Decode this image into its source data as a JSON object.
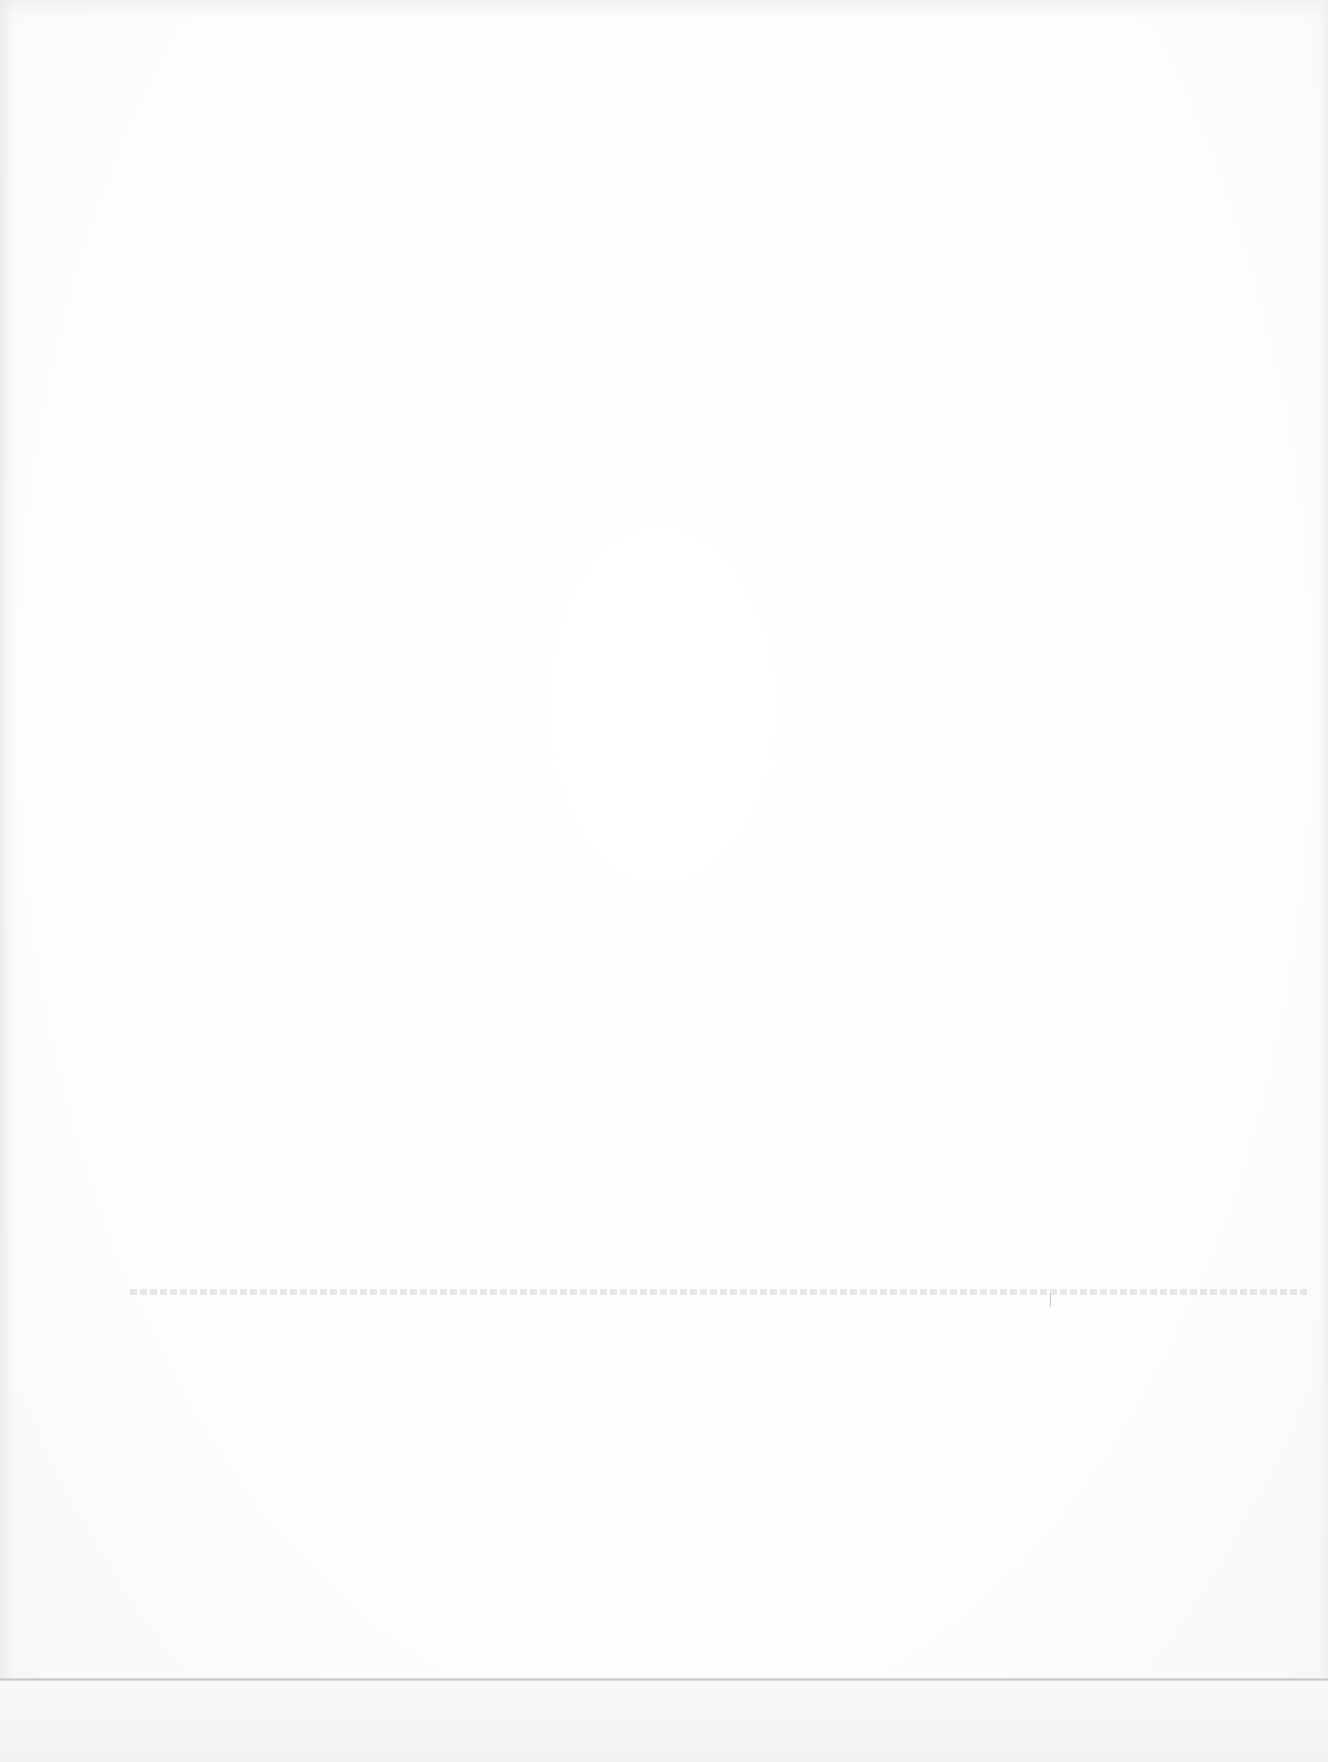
{
  "document": {
    "type": "blank-scanned-page",
    "visible_text": "",
    "bleed_through_text": "",
    "has_fold_line": true
  },
  "colors": {
    "paper": "#ffffff",
    "fold_line": "#c8c8c8",
    "bleed_through": "#bebebe"
  }
}
